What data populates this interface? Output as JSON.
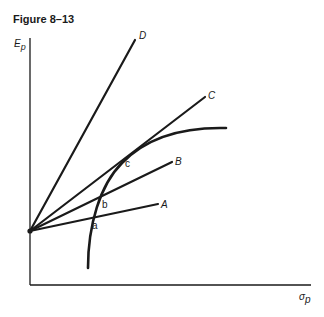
{
  "figure": {
    "title": "Figure 8–13",
    "y_axis_label": "E",
    "y_axis_subscript": "p",
    "x_axis_label": "σ",
    "x_axis_subscript": "p"
  },
  "lines": [
    {
      "id": "A",
      "label": "A"
    },
    {
      "id": "B",
      "label": "B"
    },
    {
      "id": "C",
      "label": "C"
    },
    {
      "id": "D",
      "label": "D"
    }
  ],
  "points": [
    {
      "id": "a",
      "label": "a"
    },
    {
      "id": "b",
      "label": "b"
    },
    {
      "id": "c",
      "label": "c"
    }
  ],
  "colors": {
    "ink": "#1a1a1a",
    "background": "#ffffff"
  }
}
